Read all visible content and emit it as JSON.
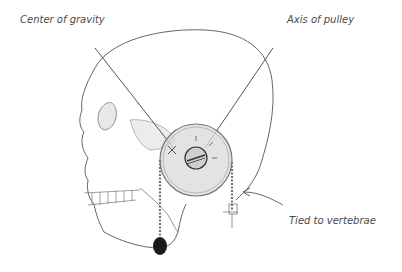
{
  "diagram": {
    "labels": {
      "center_of_gravity": "Center of gravity",
      "axis_of_pulley": "Axis of pulley",
      "tied_to_vertebrae": "Tied to vertebrae"
    },
    "colors": {
      "line": "#555555",
      "pulley_fill": "#d9d9d9",
      "weight_fill": "#1a1a1a",
      "text": "#4a4a4a"
    }
  }
}
